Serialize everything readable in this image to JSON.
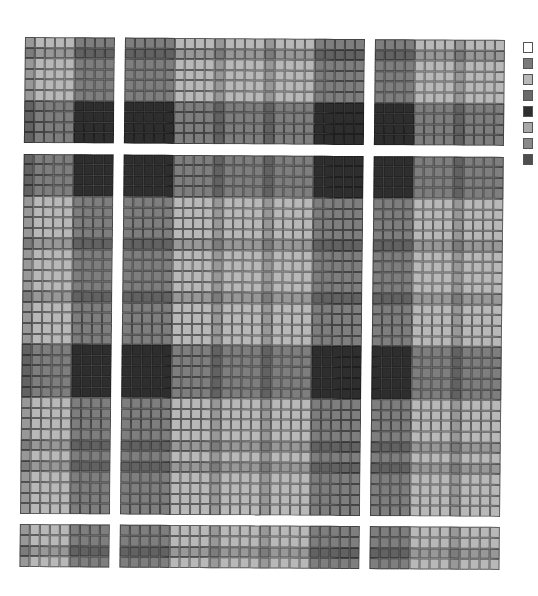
{
  "chart_data": {
    "type": "heatmap",
    "title": "",
    "xlabel": "",
    "ylabel": "",
    "grid": true,
    "legend_position": "right",
    "band_tones": {
      "W": "#ffffff",
      "L": "#b4b4b4",
      "M": "#7c7c7c",
      "D": "#484848"
    },
    "column_bands": [
      "M",
      "L",
      "L",
      "L",
      "L",
      "D",
      "D",
      "D",
      "D",
      "W",
      "D",
      "D",
      "D",
      "D",
      "D",
      "L",
      "L",
      "L",
      "L",
      "M",
      "L",
      "L",
      "L",
      "L",
      "M",
      "L",
      "L",
      "L",
      "L",
      "D",
      "D",
      "D",
      "D",
      "D",
      "W",
      "D",
      "D",
      "D",
      "D",
      "L",
      "L",
      "L",
      "L",
      "M",
      "L",
      "L",
      "L",
      "L"
    ],
    "row_bands": [
      "L",
      "M",
      "L",
      "L",
      "L",
      "L",
      "D",
      "D",
      "D",
      "D",
      "W",
      "D",
      "D",
      "D",
      "D",
      "L",
      "L",
      "L",
      "L",
      "M",
      "L",
      "L",
      "L",
      "L",
      "M",
      "L",
      "L",
      "L",
      "L",
      "D",
      "D",
      "D",
      "D",
      "D",
      "L",
      "L",
      "L",
      "L",
      "M",
      "L",
      "M",
      "L",
      "L",
      "L",
      "L",
      "W",
      "L",
      "L",
      "M",
      "L"
    ],
    "legend": [
      {
        "label": "",
        "color": "#ffffff"
      },
      {
        "label": "",
        "color": "#7a7a7a"
      },
      {
        "label": "",
        "color": "#b8b8b8"
      },
      {
        "label": "",
        "color": "#6a6a6a"
      },
      {
        "label": "",
        "color": "#2e2e2e"
      },
      {
        "label": "",
        "color": "#a8a8a8"
      },
      {
        "label": "",
        "color": "#8a8a8a"
      },
      {
        "label": "",
        "color": "#4e4e4e"
      }
    ]
  }
}
